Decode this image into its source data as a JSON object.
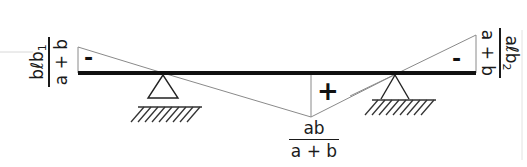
{
  "diagram": {
    "colors": {
      "beam": "#111111",
      "diagram_line": "#8a8a8a",
      "support": "#222222",
      "hatch": "#333333",
      "guide_line": "#d8d8d8",
      "text": "#1a1a1a"
    },
    "beam": {
      "x1": 78,
      "x2": 476,
      "y": 73,
      "thickness": 4
    },
    "supports": [
      {
        "name": "left-support",
        "apex_x": 163,
        "apex_y": 75,
        "half_base": 15,
        "base_y": 98,
        "ground_y": 107,
        "ground_x1": 138,
        "ground_x2": 202
      },
      {
        "name": "right-support",
        "apex_x": 395,
        "apex_y": 75,
        "half_base": 15,
        "base_y": 98,
        "ground_y": 101,
        "ground_x1": 372,
        "ground_x2": 436
      }
    ],
    "influence_polygon": {
      "left_overhang_top": [
        78,
        47
      ],
      "left_zero": [
        163,
        73
      ],
      "peak": [
        311,
        117
      ],
      "right_zero": [
        398,
        73
      ],
      "right_overhang_top": [
        476,
        35
      ]
    },
    "signs": {
      "left": "-",
      "middle": "+",
      "right": "-"
    },
    "labels": {
      "left": {
        "num_main": "bℓb",
        "num_sub": "1",
        "den": "a + b"
      },
      "right": {
        "num_main": "aℓb",
        "num_sub": "2",
        "den": "a + b"
      },
      "bottom": {
        "num": "ab",
        "den": "a + b"
      }
    }
  }
}
